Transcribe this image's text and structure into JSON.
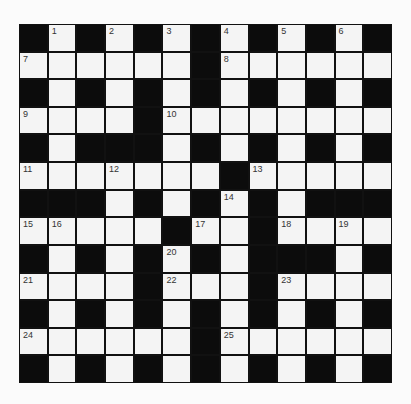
{
  "puzzle": {
    "size": {
      "rows": 13,
      "cols": 13
    },
    "colors": {
      "block": "#0c0c0c",
      "cell": "#f4f4f4",
      "number": "#333333"
    },
    "grid": [
      [
        "#",
        "1",
        "#",
        "2",
        "#",
        "3",
        "#",
        "4",
        "#",
        "5",
        "#",
        "6",
        "#"
      ],
      [
        "7",
        ".",
        ".",
        ".",
        ".",
        ".",
        "#",
        "8",
        ".",
        ".",
        ".",
        ".",
        "."
      ],
      [
        "#",
        ".",
        "#",
        ".",
        "#",
        ".",
        "#",
        ".",
        "#",
        ".",
        "#",
        ".",
        "#"
      ],
      [
        "9",
        ".",
        ".",
        ".",
        "#",
        "10",
        ".",
        ".",
        ".",
        ".",
        ".",
        ".",
        "."
      ],
      [
        "#",
        ".",
        "#",
        "#",
        "#",
        ".",
        "#",
        ".",
        "#",
        ".",
        "#",
        ".",
        "#"
      ],
      [
        "11",
        ".",
        ".",
        "12",
        ".",
        ".",
        ".",
        "#",
        "13",
        ".",
        ".",
        ".",
        "."
      ],
      [
        "#",
        "#",
        "#",
        ".",
        "#",
        ".",
        "#",
        "14",
        "#",
        ".",
        "#",
        "#",
        "#"
      ],
      [
        "15",
        "16",
        ".",
        ".",
        ".",
        "#",
        "17",
        ".",
        "#",
        "18",
        ".",
        "19",
        "."
      ],
      [
        "#",
        ".",
        "#",
        ".",
        "#",
        "20",
        "#",
        ".",
        "#",
        "#",
        "#",
        ".",
        "#"
      ],
      [
        "21",
        ".",
        ".",
        ".",
        "#",
        "22",
        ".",
        ".",
        "#",
        "23",
        ".",
        ".",
        "."
      ],
      [
        "#",
        ".",
        "#",
        ".",
        "#",
        ".",
        "#",
        ".",
        "#",
        ".",
        "#",
        ".",
        "#"
      ],
      [
        "24",
        ".",
        ".",
        ".",
        ".",
        ".",
        "#",
        "25",
        ".",
        ".",
        ".",
        ".",
        "."
      ],
      [
        "#",
        ".",
        "#",
        ".",
        "#",
        ".",
        "#",
        ".",
        "#",
        ".",
        "#",
        ".",
        "#"
      ]
    ],
    "clue_numbers": [
      "1",
      "2",
      "3",
      "4",
      "5",
      "6",
      "7",
      "8",
      "9",
      "10",
      "11",
      "12",
      "13",
      "14",
      "15",
      "16",
      "17",
      "18",
      "19",
      "20",
      "21",
      "22",
      "23",
      "24",
      "25"
    ]
  }
}
